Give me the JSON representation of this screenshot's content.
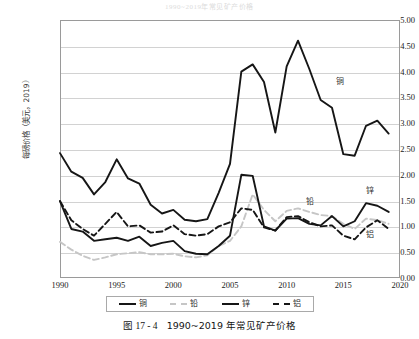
{
  "title": "1990~2019年常见矿产价格",
  "caption": {
    "figure_number": "图 17 - 4",
    "text": "1990~2019 年常见矿产价格"
  },
  "axes": {
    "y_title": "每磅价格（美元，2019）",
    "y_ticks": [
      "5.00",
      "4.50",
      "4.00",
      "3.50",
      "3.00",
      "2.50",
      "2.00",
      "1.50",
      "1.00",
      "0.50",
      "0.00"
    ],
    "x_ticks": [
      "1990",
      "1995",
      "2000",
      "2005",
      "2010",
      "2015",
      "2020"
    ]
  },
  "legend": {
    "items": [
      {
        "label": "铜",
        "style": "solid",
        "color": "#161616"
      },
      {
        "label": "铅",
        "style": "dashed",
        "color": "#c6c6c6"
      },
      {
        "label": "锌",
        "style": "solid",
        "color": "#161616"
      },
      {
        "label": "铝",
        "style": "dashed",
        "color": "#161616"
      }
    ]
  },
  "inline_labels": [
    {
      "name": "copper",
      "label": "铜"
    },
    {
      "name": "lead",
      "label": "铅"
    },
    {
      "name": "zinc",
      "label": "锌"
    },
    {
      "name": "aluminum",
      "label": "铝"
    }
  ],
  "chart_data": {
    "type": "line",
    "title": "1990~2019年常见矿产价格",
    "xlabel": "",
    "ylabel": "每磅价格（美元，2019）",
    "xlim": [
      1990,
      2020
    ],
    "ylim": [
      0.0,
      5.0
    ],
    "ytick_step": 0.5,
    "xtick_step": 5,
    "grid": true,
    "legend_position": "bottom",
    "x": [
      1990,
      1991,
      1992,
      1993,
      1994,
      1995,
      1996,
      1997,
      1998,
      1999,
      2000,
      2001,
      2002,
      2003,
      2004,
      2005,
      2006,
      2007,
      2008,
      2009,
      2010,
      2011,
      2012,
      2013,
      2014,
      2015,
      2016,
      2017,
      2018,
      2019
    ],
    "series": [
      {
        "name": "铜",
        "style": "solid",
        "color": "#161616",
        "values": [
          2.42,
          2.06,
          1.94,
          1.62,
          1.86,
          2.3,
          1.93,
          1.83,
          1.42,
          1.25,
          1.32,
          1.13,
          1.1,
          1.14,
          1.65,
          2.21,
          4.0,
          4.14,
          3.8,
          2.82,
          4.1,
          4.6,
          4.05,
          3.45,
          3.3,
          2.4,
          2.37,
          2.95,
          3.05,
          2.8
        ]
      },
      {
        "name": "铅",
        "style": "dashed",
        "color": "#c6c6c6",
        "values": [
          0.7,
          0.55,
          0.43,
          0.35,
          0.4,
          0.46,
          0.48,
          0.5,
          0.46,
          0.46,
          0.47,
          0.42,
          0.4,
          0.44,
          0.62,
          0.72,
          1.0,
          1.62,
          1.32,
          1.1,
          1.3,
          1.35,
          1.28,
          1.22,
          1.2,
          1.05,
          0.95,
          1.15,
          1.12,
          1.05
        ]
      },
      {
        "name": "锌",
        "style": "solid",
        "color": "#161616",
        "values": [
          1.49,
          0.95,
          0.9,
          0.72,
          0.75,
          0.78,
          0.72,
          0.8,
          0.62,
          0.68,
          0.72,
          0.52,
          0.47,
          0.46,
          0.62,
          0.82,
          2.0,
          1.98,
          1.0,
          0.92,
          1.15,
          1.16,
          1.05,
          1.02,
          1.2,
          1.0,
          1.1,
          1.45,
          1.4,
          1.28
        ]
      },
      {
        "name": "铝",
        "style": "dashed",
        "color": "#161616",
        "values": [
          1.49,
          1.12,
          0.95,
          0.82,
          1.05,
          1.28,
          1.0,
          1.02,
          0.88,
          0.9,
          1.02,
          0.85,
          0.82,
          0.85,
          1.0,
          1.08,
          1.35,
          1.32,
          0.98,
          0.92,
          1.18,
          1.2,
          1.08,
          1.0,
          1.02,
          0.82,
          0.75,
          0.98,
          1.12,
          0.95
        ]
      }
    ]
  }
}
